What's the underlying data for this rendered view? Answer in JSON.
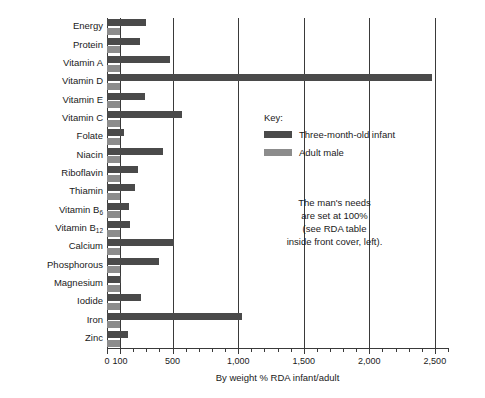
{
  "chart_data": {
    "type": "bar",
    "orientation": "horizontal",
    "title": "",
    "xlabel": "By weight % RDA infant/adult",
    "ylabel": "",
    "xlim": [
      0,
      2600
    ],
    "grid": true,
    "gridlines": [
      100,
      500,
      1000,
      1500,
      2000,
      2500
    ],
    "tick_labels": [
      "0",
      "100",
      "500",
      "1,000",
      "1,500",
      "2,000",
      "2,500"
    ],
    "tick_values": [
      0,
      100,
      500,
      1000,
      1500,
      2000,
      2500
    ],
    "minor_tick_step": 100,
    "categories": [
      "Energy",
      "Protein",
      "Vitamin A",
      "Vitamin D",
      "Vitamin E",
      "Vitamin C",
      "Folate",
      "Niacin",
      "Riboflavin",
      "Thiamin",
      "Vitamin B6",
      "Vitamin B12",
      "Calcium",
      "Phosphorous",
      "Magnesium",
      "Iodide",
      "Iron",
      "Zinc"
    ],
    "category_labels_html": [
      "Energy",
      "Protein",
      "Vitamin A",
      "Vitamin D",
      "Vitamin E",
      "Vitamin C",
      "Folate",
      "Niacin",
      "Riboflavin",
      "Thiamin",
      "Vitamin B<sub>6</sub>",
      "Vitamin B<sub>12</sub>",
      "Calcium",
      "Phosphorous",
      "Magnesium",
      "Iodide",
      "Iron",
      "Zinc"
    ],
    "series": [
      {
        "name": "Three-month-old infant",
        "color": "#4a4a4a",
        "values": [
          300,
          250,
          480,
          2480,
          290,
          570,
          130,
          430,
          240,
          215,
          165,
          175,
          510,
          400,
          110,
          260,
          1030,
          160
        ]
      },
      {
        "name": "Adult male",
        "color": "#8c8c8c",
        "values": [
          100,
          100,
          100,
          100,
          100,
          100,
          100,
          100,
          100,
          100,
          100,
          100,
          100,
          100,
          100,
          100,
          100,
          100
        ]
      }
    ],
    "legend": {
      "title": "Key:",
      "position": "inside-right",
      "entries": [
        {
          "label": "Three-month-old infant",
          "color": "#4a4a4a"
        },
        {
          "label": "Adult male",
          "color": "#8c8c8c"
        }
      ]
    },
    "annotation": {
      "lines": [
        "The man's needs",
        "are set at 100%",
        "(see RDA table",
        "inside front cover, left)."
      ]
    }
  }
}
